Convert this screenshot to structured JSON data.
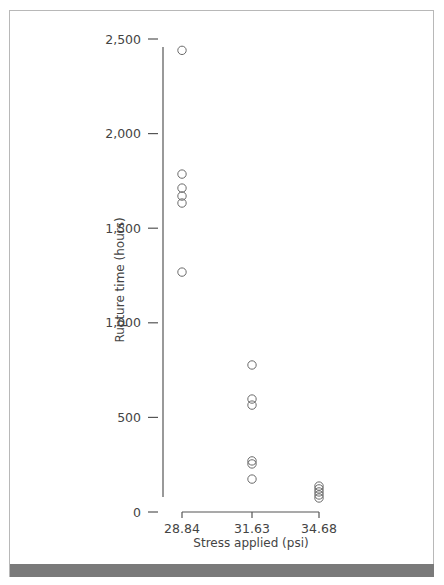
{
  "chart_data": {
    "type": "scatter",
    "title": "",
    "xlabel": "Stress applied (psi)",
    "ylabel": "Rupture time (hours)",
    "x_categories": [
      "28.84",
      "31.63",
      "34.68"
    ],
    "y_ticks": [
      0,
      500,
      1000,
      1500,
      2000,
      2500
    ],
    "y_tick_labels": [
      "0",
      "500",
      "1,000",
      "1,500",
      "2,000",
      "2,500"
    ],
    "ylim": [
      0,
      2500
    ],
    "grid": false,
    "legend": null,
    "marker": "open-circle",
    "series": [
      {
        "name": "Rupture times",
        "points": [
          {
            "x": "28.84",
            "y": 2440
          },
          {
            "x": "28.84",
            "y": 1786
          },
          {
            "x": "28.84",
            "y": 1712
          },
          {
            "x": "28.84",
            "y": 1670
          },
          {
            "x": "28.84",
            "y": 1633
          },
          {
            "x": "28.84",
            "y": 1268
          },
          {
            "x": "31.63",
            "y": 777
          },
          {
            "x": "31.63",
            "y": 597
          },
          {
            "x": "31.63",
            "y": 565
          },
          {
            "x": "31.63",
            "y": 270
          },
          {
            "x": "31.63",
            "y": 254
          },
          {
            "x": "31.63",
            "y": 174
          },
          {
            "x": "34.68",
            "y": 137
          },
          {
            "x": "34.68",
            "y": 122
          },
          {
            "x": "34.68",
            "y": 106
          },
          {
            "x": "34.68",
            "y": 90
          },
          {
            "x": "34.68",
            "y": 74
          }
        ]
      }
    ]
  },
  "colors": {
    "axis": "#555555",
    "marker_stroke": "#6a6a6a",
    "frame_border": "#b8b8b8",
    "bottom_bar": "#7a7a7a"
  }
}
